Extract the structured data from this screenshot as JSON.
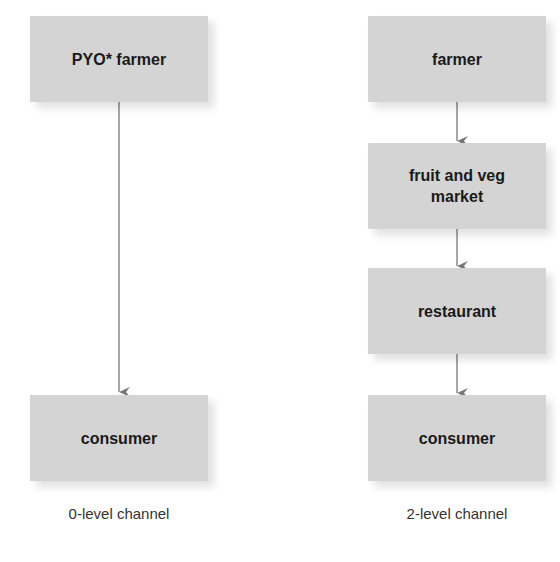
{
  "diagram": {
    "colors": {
      "box_fill": "#d4d4d4",
      "arrow": "#777777",
      "text": "#1a1a1a",
      "caption": "#333333"
    },
    "channels": [
      {
        "caption": "0-level channel",
        "nodes": [
          {
            "label": "PYO* farmer"
          },
          {
            "label": "consumer"
          }
        ]
      },
      {
        "caption": "2-level channel",
        "nodes": [
          {
            "label": "farmer"
          },
          {
            "label": "fruit and veg\nmarket"
          },
          {
            "label": "restaurant"
          },
          {
            "label": "consumer"
          }
        ]
      }
    ]
  }
}
